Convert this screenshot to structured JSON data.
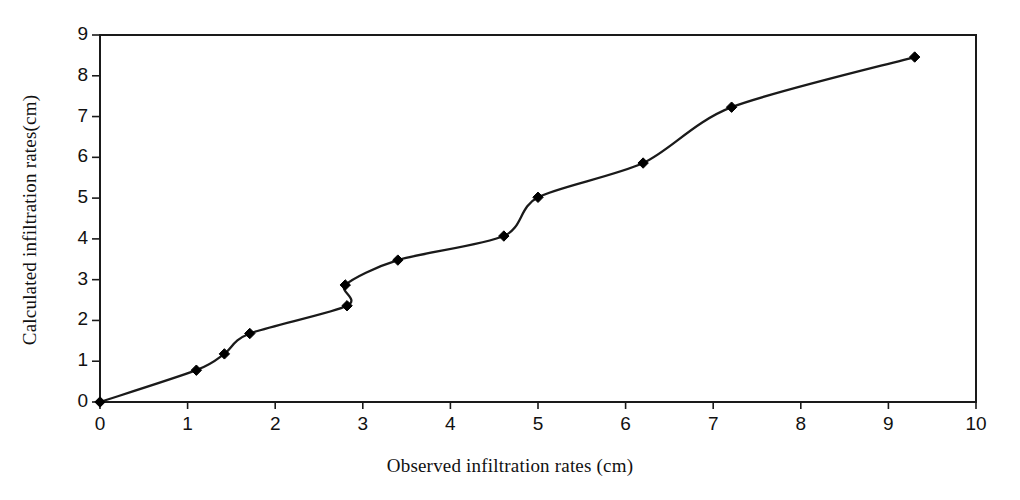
{
  "chart_data": {
    "type": "line",
    "title": "",
    "subtitle": "",
    "xlabel": "Observed infiltration rates (cm)",
    "ylabel": "Calculated infiltration rates(cm)",
    "xlim": [
      0,
      10
    ],
    "ylim": [
      0,
      9
    ],
    "xticks": [
      0,
      1,
      2,
      3,
      4,
      5,
      6,
      7,
      8,
      9,
      10
    ],
    "xtick_labels": [
      "0",
      "1",
      "2",
      "3",
      "4",
      "5",
      "6",
      "7",
      "8",
      "9",
      "10"
    ],
    "yticks": [
      0,
      1,
      2,
      3,
      4,
      5,
      6,
      7,
      8,
      9
    ],
    "ytick_labels": [
      "0",
      "1",
      "2",
      "3",
      "4",
      "5",
      "6",
      "7",
      "8",
      "9"
    ],
    "grid": false,
    "legend": false,
    "legend_position": "none",
    "line_color": "#1a1a1a",
    "marker": "diamond",
    "marker_color": "#000000",
    "series": [
      {
        "name": "Calculated vs observed infiltration",
        "points": [
          {
            "x": 0.0,
            "y": 0.0
          },
          {
            "x": 1.1,
            "y": 0.78
          },
          {
            "x": 1.42,
            "y": 1.18
          },
          {
            "x": 1.71,
            "y": 1.68
          },
          {
            "x": 2.82,
            "y": 2.36
          },
          {
            "x": 2.8,
            "y": 2.87
          },
          {
            "x": 3.4,
            "y": 3.48
          },
          {
            "x": 4.61,
            "y": 4.07
          },
          {
            "x": 5.0,
            "y": 5.02
          },
          {
            "x": 6.2,
            "y": 5.86
          },
          {
            "x": 7.21,
            "y": 7.23
          },
          {
            "x": 9.3,
            "y": 8.46
          }
        ]
      }
    ]
  }
}
